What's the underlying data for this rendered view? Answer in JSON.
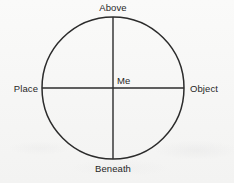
{
  "figure": {
    "type": "axis-circle-diagram",
    "background_color": "#f7f7f6",
    "stroke_color": "#2b2b2b",
    "text_color": "#272727",
    "geometry": {
      "center_x": 113,
      "center_y": 88,
      "radius": 71
    },
    "labels": {
      "top": "Above",
      "bottom": "Beneath",
      "left": "Place",
      "right": "Object",
      "center": "Me"
    }
  }
}
